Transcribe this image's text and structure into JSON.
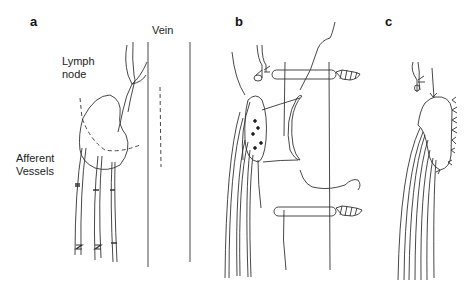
{
  "panels": [
    {
      "id": "a",
      "label": "a"
    },
    {
      "id": "b",
      "label": "b"
    },
    {
      "id": "c",
      "label": "c"
    }
  ],
  "labels": {
    "vein": "Vein",
    "lymph_node_line1": "Lymph",
    "lymph_node_line2": "node",
    "afferent_line1": "Afferent",
    "afferent_line2": "Vessels"
  },
  "colors": {
    "stroke": "#333333",
    "background": "#ffffff"
  }
}
